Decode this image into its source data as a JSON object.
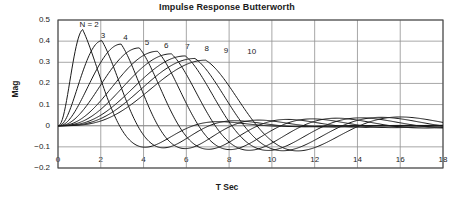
{
  "chart_data": {
    "type": "line",
    "title": "Impulse Response Butterworth",
    "xlabel": "T Sec",
    "ylabel": "Mag",
    "xlim": [
      0,
      18
    ],
    "ylim": [
      -0.2,
      0.5
    ],
    "grid": true,
    "legend_position": "inline-annotations",
    "xticks": [
      "0",
      "2",
      "4",
      "6",
      "8",
      "10",
      "12",
      "14",
      "16",
      "18"
    ],
    "xtick_values": [
      0,
      2,
      4,
      6,
      8,
      10,
      12,
      14,
      16,
      18
    ],
    "yticks": [
      "0.5",
      "0.4",
      "0.3",
      "0.2",
      "0.1",
      "0",
      "−0.1",
      "−0.2"
    ],
    "ytick_values": [
      0.5,
      0.4,
      0.3,
      0.2,
      0.1,
      0,
      -0.1,
      -0.2
    ],
    "annotations": [
      {
        "text": "N = 2",
        "x": 1.0,
        "y": 0.475
      },
      {
        "text": "3",
        "x": 2.0,
        "y": 0.425
      },
      {
        "text": "4",
        "x": 3.05,
        "y": 0.415
      },
      {
        "text": "5",
        "x": 4.05,
        "y": 0.392
      },
      {
        "text": "6",
        "x": 4.95,
        "y": 0.378
      },
      {
        "text": "7",
        "x": 5.95,
        "y": 0.372
      },
      {
        "text": "8",
        "x": 6.85,
        "y": 0.362
      },
      {
        "text": "9",
        "x": 7.75,
        "y": 0.352
      },
      {
        "text": "10",
        "x": 8.85,
        "y": 0.348
      }
    ],
    "series": [
      {
        "name": "N = 2",
        "order": 2,
        "peak_t": 1.15,
        "peak_mag": 0.455,
        "trough_t": 4.6,
        "trough_mag": -0.095
      },
      {
        "name": "3",
        "order": 3,
        "peak_t": 2.05,
        "peak_mag": 0.402,
        "trough_t": 5.4,
        "trough_mag": -0.1
      },
      {
        "name": "4",
        "order": 4,
        "peak_t": 2.95,
        "peak_mag": 0.386,
        "trough_t": 6.4,
        "trough_mag": -0.105
      },
      {
        "name": "5",
        "order": 5,
        "peak_t": 3.8,
        "peak_mag": 0.368,
        "trough_t": 7.5,
        "trough_mag": -0.11
      },
      {
        "name": "6",
        "order": 6,
        "peak_t": 4.65,
        "peak_mag": 0.352,
        "trough_t": 8.5,
        "trough_mag": -0.113
      },
      {
        "name": "7",
        "order": 7,
        "peak_t": 5.3,
        "peak_mag": 0.34,
        "trough_t": 9.4,
        "trough_mag": -0.118
      },
      {
        "name": "8",
        "order": 8,
        "peak_t": 5.95,
        "peak_mag": 0.33,
        "trough_t": 10.3,
        "trough_mag": -0.12
      },
      {
        "name": "9",
        "order": 9,
        "peak_t": 6.4,
        "peak_mag": 0.318,
        "trough_t": 11.0,
        "trough_mag": -0.123
      },
      {
        "name": "10",
        "order": 10,
        "peak_t": 6.9,
        "peak_mag": 0.31,
        "trough_t": 11.7,
        "trough_mag": -0.125
      }
    ],
    "colors": {
      "line": "#1a1a1a",
      "grid": "#909090",
      "axis": "#555555",
      "background": "#ffffff"
    }
  }
}
